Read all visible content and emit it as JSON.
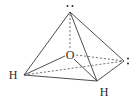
{
  "diagram": {
    "title": "",
    "molecule": "H2O",
    "geometry": "tetrahedral electron-pair arrangement",
    "central_atom": {
      "symbol": "O"
    },
    "substituents": [
      {
        "id": "h-left",
        "symbol": "H"
      },
      {
        "id": "h-front",
        "symbol": "H"
      }
    ],
    "lone_pairs": [
      {
        "id": "lp-top",
        "glyph": "··"
      },
      {
        "id": "lp-right",
        "glyph": ":"
      }
    ],
    "colors": {
      "line": "#3a3a3a",
      "text": "#2a2a2a",
      "background": "#ffffff"
    }
  }
}
